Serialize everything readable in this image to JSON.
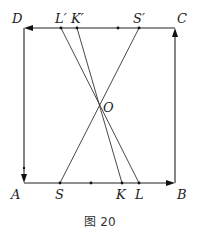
{
  "figure": {
    "caption": "图 20",
    "points": {
      "A": {
        "label": "A",
        "x": 24,
        "y": 183
      },
      "B": {
        "label": "B",
        "x": 175,
        "y": 183
      },
      "C": {
        "label": "C",
        "x": 175,
        "y": 28
      },
      "D": {
        "label": "D",
        "x": 25,
        "y": 28
      },
      "O": {
        "label": "O",
        "x": 100,
        "y": 106
      },
      "S": {
        "label": "S",
        "x": 60,
        "y": 183
      },
      "K": {
        "label": "K",
        "x": 122,
        "y": 183
      },
      "L": {
        "label": "L",
        "x": 139,
        "y": 183
      },
      "S_prime": {
        "label": "S′",
        "x": 139,
        "y": 28
      },
      "K_prime": {
        "label": "K′",
        "x": 77,
        "y": 28
      },
      "L_prime": {
        "label": "L′",
        "x": 61,
        "y": 28
      }
    },
    "segments": [
      {
        "from": "L_prime",
        "to": "L"
      },
      {
        "from": "K_prime",
        "to": "K"
      },
      {
        "from": "S_prime",
        "to": "S"
      }
    ],
    "arrows": [
      {
        "name": "A-to-B",
        "direction": "right"
      },
      {
        "name": "B-to-C",
        "direction": "up"
      },
      {
        "name": "C-to-D",
        "direction": "left"
      },
      {
        "name": "D-to-A",
        "direction": "down"
      }
    ],
    "midpoint_dots": [
      {
        "x": 91,
        "y": 183
      },
      {
        "x": 118,
        "y": 28
      }
    ]
  }
}
